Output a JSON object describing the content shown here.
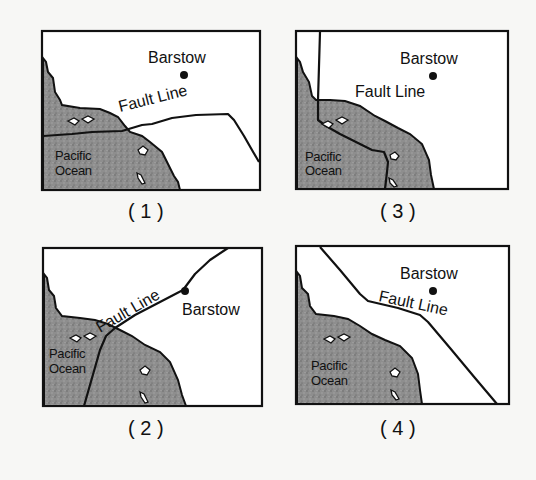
{
  "figure": {
    "panels": [
      {
        "id": "1",
        "caption": "( 1 )",
        "city_label": "Barstow",
        "fault_label": "Fault Line",
        "ocean_label_line1": "Pacific",
        "ocean_label_line2": "Ocean"
      },
      {
        "id": "2",
        "caption": "( 2 )",
        "city_label": "Barstow",
        "fault_label": "Fault Line",
        "ocean_label_line1": "Pacific",
        "ocean_label_line2": "Ocean"
      },
      {
        "id": "3",
        "caption": "( 3 )",
        "city_label": "Barstow",
        "fault_label": "Fault Line",
        "ocean_label_line1": "Pacific",
        "ocean_label_line2": "Ocean"
      },
      {
        "id": "4",
        "caption": "( 4 )",
        "city_label": "Barstow",
        "fault_label": "Fault Line",
        "ocean_label_line1": "Pacific",
        "ocean_label_line2": "Ocean"
      }
    ],
    "colors": {
      "ocean": "#8a8a8a",
      "land": "#ffffff",
      "lines": "#111111"
    }
  }
}
